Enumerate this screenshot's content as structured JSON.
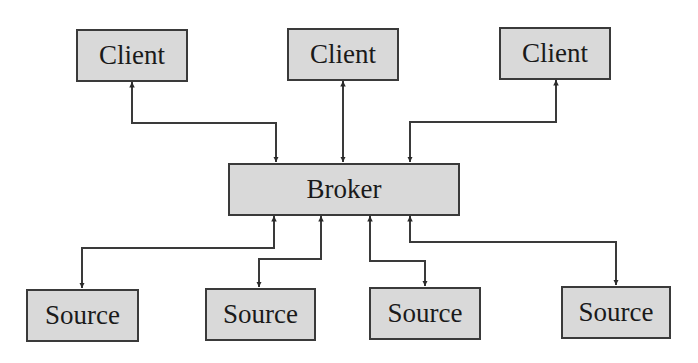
{
  "diagram": {
    "type": "client-broker-source architecture",
    "colors": {
      "node_fill": "#d9d9d9",
      "node_border": "#3a3a3a",
      "line": "#3a3a3a",
      "background": "#ffffff"
    },
    "nodes": {
      "client_1": {
        "label": "Client"
      },
      "client_2": {
        "label": "Client"
      },
      "client_3": {
        "label": "Client"
      },
      "broker": {
        "label": "Broker"
      },
      "source_1": {
        "label": "Source"
      },
      "source_2": {
        "label": "Source"
      },
      "source_3": {
        "label": "Source"
      },
      "source_4": {
        "label": "Source"
      }
    },
    "edges": [
      {
        "from": "client_1",
        "to": "broker",
        "bidirectional": true
      },
      {
        "from": "client_2",
        "to": "broker",
        "bidirectional": true
      },
      {
        "from": "client_3",
        "to": "broker",
        "bidirectional": true
      },
      {
        "from": "broker",
        "to": "source_1",
        "bidirectional": true
      },
      {
        "from": "broker",
        "to": "source_2",
        "bidirectional": true
      },
      {
        "from": "broker",
        "to": "source_3",
        "bidirectional": true
      },
      {
        "from": "broker",
        "to": "source_4",
        "bidirectional": true
      }
    ]
  }
}
